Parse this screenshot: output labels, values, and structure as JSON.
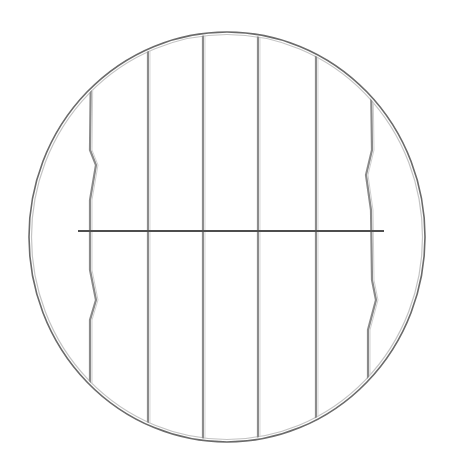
{
  "image": {
    "subject": "Round wire cooling rack",
    "description": "Circular stainless steel wire rack with six vertical wires and one horizontal cross wire, on a white background",
    "colors": {
      "background": "#ffffff",
      "wire_dark": "#5a5a5a",
      "wire_light": "#b0b0b0"
    },
    "rack": {
      "center": [
        227,
        237
      ],
      "radius_x": 198,
      "radius_y": 205,
      "vertical_wires_x": [
        90,
        148,
        203,
        258,
        316,
        372
      ],
      "cross_wire_y": 231,
      "cross_wire_x_range": [
        78,
        384
      ]
    }
  }
}
